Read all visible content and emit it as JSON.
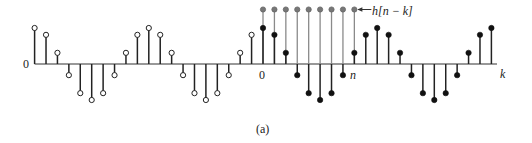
{
  "figure": {
    "caption": "(a)",
    "origin_label": "0",
    "k_zero_label": "0",
    "n_label": "n",
    "axis_label": "k",
    "h_label": "h[n − k]"
  },
  "chart_data": {
    "type": "stem",
    "title": "",
    "xlabel": "k",
    "ylabel": "",
    "x_range": [
      -20,
      20
    ],
    "series": [
      {
        "name": "x[k]",
        "marker": "open for k<0, filled for k>=0",
        "k": [
          -20,
          -19,
          -18,
          -17,
          -16,
          -15,
          -14,
          -13,
          -12,
          -11,
          -10,
          -9,
          -8,
          -7,
          -6,
          -5,
          -4,
          -3,
          -2,
          -1,
          0,
          1,
          2,
          3,
          4,
          5,
          6,
          7,
          8,
          9,
          10,
          11,
          12,
          13,
          14,
          15,
          16,
          17,
          18,
          19,
          20
        ],
        "values": [
          1.0,
          0.81,
          0.31,
          -0.31,
          -0.81,
          -1.0,
          -0.81,
          -0.31,
          0.31,
          0.81,
          1.0,
          0.81,
          0.31,
          -0.31,
          -0.81,
          -1.0,
          -0.81,
          -0.31,
          0.31,
          0.81,
          1.0,
          0.81,
          0.31,
          -0.31,
          -0.81,
          -1.0,
          -0.81,
          -0.31,
          0.31,
          0.81,
          1.0,
          0.81,
          0.31,
          -0.31,
          -0.81,
          -1.0,
          -0.81,
          -0.31,
          0.31,
          0.81,
          1.0
        ]
      },
      {
        "name": "h[n-k]",
        "marker": "filled gray",
        "k": [
          0,
          1,
          2,
          3,
          4,
          5,
          6,
          7,
          8
        ],
        "values": [
          1.5,
          1.5,
          1.5,
          1.5,
          1.5,
          1.5,
          1.5,
          1.5,
          1.5
        ]
      }
    ],
    "annotations": [
      "0 (origin)",
      "0 (k=0)",
      "n",
      "k",
      "h[n − k]",
      "(a)"
    ]
  }
}
